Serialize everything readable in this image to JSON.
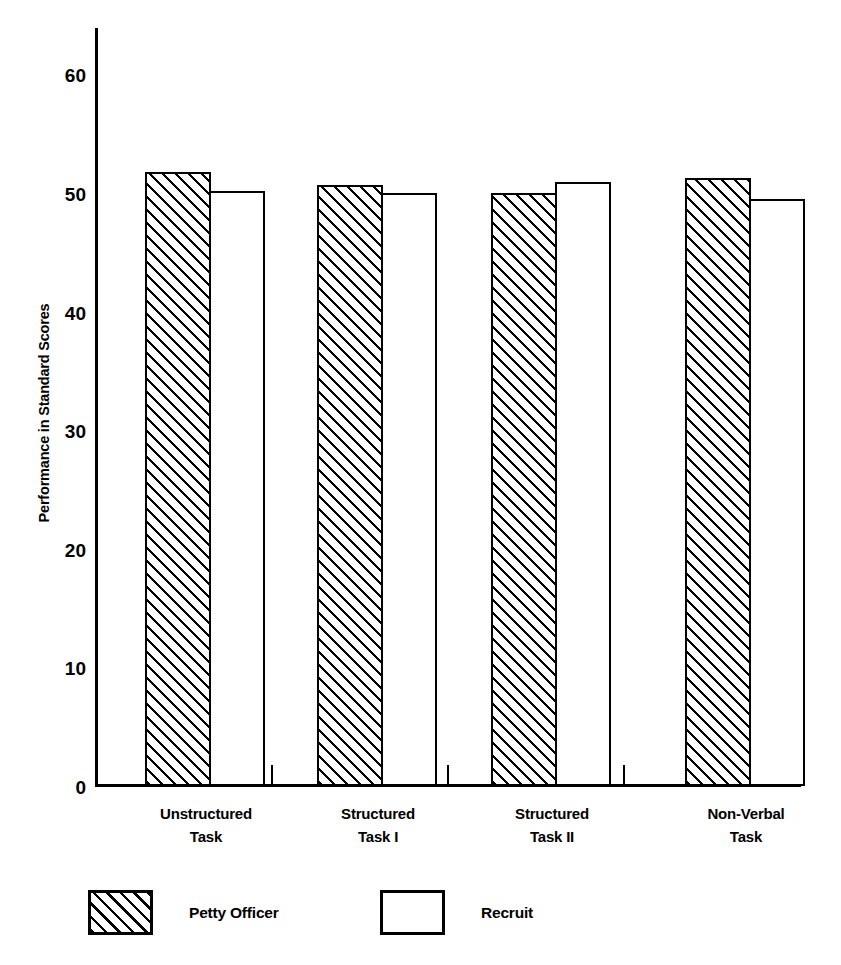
{
  "chart_data": {
    "type": "bar",
    "title": "",
    "xlabel": "",
    "ylabel": "Performance in Standard Scores",
    "ylim": [
      0,
      64
    ],
    "yticks": [
      0,
      10,
      20,
      30,
      40,
      50,
      60
    ],
    "ytick_labels": [
      "0",
      "10",
      "20",
      "30",
      "40",
      "50",
      "60"
    ],
    "grid": false,
    "legend_position": "bottom",
    "categories": [
      {
        "line1": "Unstructured",
        "line2": "Task"
      },
      {
        "line1": "Structured",
        "line2": "Task I"
      },
      {
        "line1": "Structured",
        "line2": "Task II"
      },
      {
        "line1": "Non-Verbal",
        "line2": "Task"
      }
    ],
    "category_labels": [
      "Unstructured Task",
      "Structured Task I",
      "Structured Task II",
      "Non-Verbal Task"
    ],
    "series": [
      {
        "name": "Petty Officer",
        "pattern": "diagonal-hatch",
        "color": "#000000",
        "fill": "#ffffff",
        "values": [
          51.8,
          50.7,
          50.0,
          51.3
        ]
      },
      {
        "name": "Recruit",
        "pattern": "solid-outline",
        "color": "#000000",
        "fill": "#ffffff",
        "values": [
          50.2,
          50.0,
          50.9,
          49.5
        ]
      }
    ],
    "legend": [
      {
        "label": "Petty Officer",
        "pattern": "diagonal-hatch"
      },
      {
        "label": "Recruit",
        "pattern": "solid-outline"
      }
    ]
  },
  "axis": {
    "y_title": "Performance in Standard Scores"
  }
}
